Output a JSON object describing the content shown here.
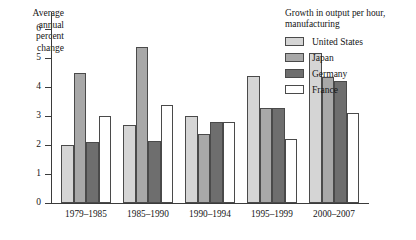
{
  "chart_data": {
    "type": "bar",
    "title": "",
    "ylabel": "Average annual percent change",
    "xlabel": "",
    "ylim": [
      0,
      6.6
    ],
    "yticks": [
      0,
      1,
      2,
      3,
      4,
      5,
      6
    ],
    "ytick_labels": [
      "0",
      "1",
      "2",
      "3",
      "4",
      "5",
      "6"
    ],
    "grid": false,
    "legend_position": "top-right",
    "legend_title": "Growth in output per hour, manufacturing",
    "categories": [
      "1979–1985",
      "1985–1990",
      "1990–1994",
      "1995–1999",
      "2000–2007"
    ],
    "series": [
      {
        "name": "United States",
        "color": "#d5d5d5",
        "values": [
          2.0,
          2.7,
          3.0,
          4.4,
          5.2
        ]
      },
      {
        "name": "Japan",
        "color": "#a8a8a8",
        "values": [
          4.5,
          5.4,
          2.4,
          3.3,
          4.35
        ]
      },
      {
        "name": "Germany",
        "color": "#6e6e6e",
        "values": [
          2.1,
          2.15,
          2.8,
          3.3,
          4.2
        ]
      },
      {
        "name": "France",
        "color": "#ffffff",
        "values": [
          3.0,
          3.4,
          2.8,
          2.2,
          3.1
        ]
      }
    ]
  },
  "axis": {
    "y_title_lines": [
      "Average",
      "annual",
      "percent",
      "change"
    ]
  }
}
